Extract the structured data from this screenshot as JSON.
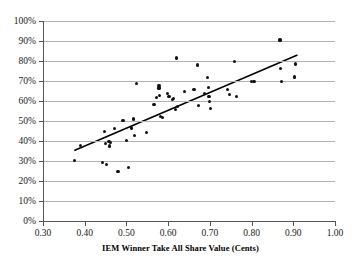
{
  "chart_data": {
    "type": "scatter",
    "title": "",
    "xlabel": "IEM Winner Take All Share Value (Cents)",
    "ylabel": "",
    "xlim": [
      0.3,
      1.0
    ],
    "ylim": [
      0,
      100
    ],
    "grid": "horizontal",
    "legend": "none",
    "x_ticks": [
      "0.30",
      "0.40",
      "0.50",
      "0.60",
      "0.70",
      "0.80",
      "0.90",
      "1.00"
    ],
    "x_tick_values": [
      0.3,
      0.4,
      0.5,
      0.6,
      0.7,
      0.8,
      0.9,
      1.0
    ],
    "y_ticks": [
      "0%",
      "10%",
      "20%",
      "30%",
      "40%",
      "50%",
      "60%",
      "70%",
      "80%",
      "90%",
      "100%"
    ],
    "y_tick_values": [
      0,
      10,
      20,
      30,
      40,
      50,
      60,
      70,
      80,
      90,
      100
    ],
    "marker_color": "#111111",
    "trendline_color": "#000000",
    "gridline_color": "#b3b3b3",
    "series": [
      {
        "name": "observations",
        "marker": "filled-circle",
        "points": [
          [
            0.375,
            30.4
          ],
          [
            0.39,
            37.8
          ],
          [
            0.442,
            29.3
          ],
          [
            0.448,
            44.8
          ],
          [
            0.45,
            38.7
          ],
          [
            0.452,
            28.2
          ],
          [
            0.458,
            39.6
          ],
          [
            0.46,
            37.5
          ],
          [
            0.462,
            39.4
          ],
          [
            0.472,
            46.2
          ],
          [
            0.48,
            24.9
          ],
          [
            0.492,
            50.3
          ],
          [
            0.5,
            40.2
          ],
          [
            0.505,
            26.8
          ],
          [
            0.512,
            46.5
          ],
          [
            0.516,
            51.0
          ],
          [
            0.52,
            42.6
          ],
          [
            0.524,
            68.6
          ],
          [
            0.548,
            44.4
          ],
          [
            0.566,
            58.2
          ],
          [
            0.572,
            61.9
          ],
          [
            0.578,
            67.8
          ],
          [
            0.578,
            66.5
          ],
          [
            0.58,
            62.6
          ],
          [
            0.582,
            52.3
          ],
          [
            0.586,
            51.9
          ],
          [
            0.598,
            63.8
          ],
          [
            0.602,
            62.3
          ],
          [
            0.61,
            60.8
          ],
          [
            0.612,
            61.4
          ],
          [
            0.618,
            55.8
          ],
          [
            0.62,
            81.5
          ],
          [
            0.622,
            57.2
          ],
          [
            0.64,
            64.8
          ],
          [
            0.662,
            65.6
          ],
          [
            0.67,
            78.0
          ],
          [
            0.672,
            57.8
          ],
          [
            0.688,
            63.6
          ],
          [
            0.694,
            71.8
          ],
          [
            0.696,
            66.7
          ],
          [
            0.698,
            62.2
          ],
          [
            0.7,
            59.8
          ],
          [
            0.702,
            56.2
          ],
          [
            0.742,
            65.8
          ],
          [
            0.748,
            63.4
          ],
          [
            0.76,
            79.6
          ],
          [
            0.764,
            62.4
          ],
          [
            0.8,
            69.7
          ],
          [
            0.806,
            69.8
          ],
          [
            0.868,
            90.5
          ],
          [
            0.87,
            76.3
          ],
          [
            0.872,
            69.9
          ],
          [
            0.902,
            72.0
          ],
          [
            0.906,
            78.5
          ]
        ]
      }
    ],
    "trendline": {
      "name": "linear-fit",
      "x_start": 0.375,
      "y_start": 35.2,
      "x_end": 0.91,
      "y_end": 83.0
    }
  }
}
